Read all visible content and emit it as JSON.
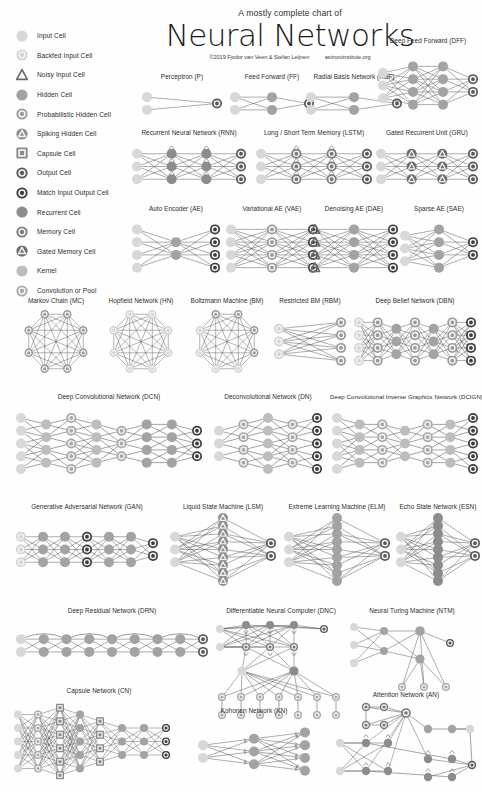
{
  "title": {
    "superline": "A mostly complete chart of",
    "main": "Neural Networks",
    "copyright": "©2019 Fjodor van Veen & Stefan Leijnen",
    "url": "asimovinstitute.org"
  },
  "palette": {
    "input": "#d8d8d8",
    "backfed": "#d4d4d4",
    "noisy": "#d0d0d0",
    "hidden": "#a3a3a3",
    "prob_hidden": "#9a9a9a",
    "spiking": "#8f8f8f",
    "capsule": "#8a8a8a",
    "output": "#585858",
    "match": "#3c3c3c",
    "recurrent": "#8c8c8c",
    "memory": "#7a7a7a",
    "gated": "#6d6d6d",
    "kernel": "#bdbdbd",
    "conv": "#a8a8a8",
    "edge": "#4a4a4a",
    "ring": "#f2f2f2",
    "text": "#2b2b2b"
  },
  "legend": {
    "items": [
      {
        "id": "input",
        "label": "Input Cell",
        "shape": "circle",
        "color_key": "input"
      },
      {
        "id": "backfed",
        "label": "Backfed Input Cell",
        "shape": "ring",
        "color_key": "backfed"
      },
      {
        "id": "noisy",
        "label": "Noisy Input Cell",
        "shape": "triangle",
        "color_key": "noisy"
      },
      {
        "id": "hidden",
        "label": "Hidden Cell",
        "shape": "circle",
        "color_key": "hidden"
      },
      {
        "id": "prob_hidden",
        "label": "Probabilistic Hidden Cell",
        "shape": "ring",
        "color_key": "prob_hidden"
      },
      {
        "id": "spiking",
        "label": "Spiking Hidden Cell",
        "shape": "tri-in-circle",
        "color_key": "spiking"
      },
      {
        "id": "capsule",
        "label": "Capsule Cell",
        "shape": "square",
        "color_key": "capsule"
      },
      {
        "id": "output",
        "label": "Output Cell",
        "shape": "ring",
        "color_key": "output"
      },
      {
        "id": "match",
        "label": "Match Input Output Cell",
        "shape": "ring",
        "color_key": "match"
      },
      {
        "id": "recurrent",
        "label": "Recurrent Cell",
        "shape": "circle",
        "color_key": "recurrent"
      },
      {
        "id": "memory",
        "label": "Memory Cell",
        "shape": "ring",
        "color_key": "memory"
      },
      {
        "id": "gated",
        "label": "Gated Memory Cell",
        "shape": "tri-in-circle",
        "color_key": "gated"
      },
      {
        "id": "kernel",
        "label": "Kernel",
        "shape": "circle",
        "color_key": "kernel"
      },
      {
        "id": "conv",
        "label": "Convolution or Pool",
        "shape": "ring",
        "color_key": "conv"
      }
    ]
  },
  "networks": [
    {
      "id": "p",
      "name": "Perceptron (P)",
      "abbr": "P",
      "x": 140,
      "y": 72,
      "w": 84,
      "h": 56,
      "layers": [
        {
          "type": "input",
          "n": 2
        },
        {
          "type": "output",
          "n": 1
        }
      ],
      "link": "full"
    },
    {
      "id": "ff",
      "name": "Feed Forward (FF)",
      "abbr": "FF",
      "x": 228,
      "y": 72,
      "w": 88,
      "h": 56,
      "layers": [
        {
          "type": "input",
          "n": 2
        },
        {
          "type": "hidden",
          "n": 2
        },
        {
          "type": "output",
          "n": 1
        }
      ],
      "link": "full"
    },
    {
      "id": "rbf",
      "name": "Radial Basis Network (RBF)",
      "abbr": "RBF",
      "x": 304,
      "y": 72,
      "w": 100,
      "h": 56,
      "layers": [
        {
          "type": "input",
          "n": 2
        },
        {
          "type": "hidden",
          "n": 2
        },
        {
          "type": "output",
          "n": 1
        }
      ],
      "link": "full"
    },
    {
      "id": "dff",
      "name": "Deep Feed Forward (DFF)",
      "abbr": "DFF",
      "x": 376,
      "y": 36,
      "w": 104,
      "h": 92,
      "layers": [
        {
          "type": "input",
          "n": 3
        },
        {
          "type": "hidden",
          "n": 4
        },
        {
          "type": "hidden",
          "n": 4
        },
        {
          "type": "output",
          "n": 2
        }
      ],
      "link": "full"
    },
    {
      "id": "rnn",
      "name": "Recurrent Neural Network (RNN)",
      "abbr": "RNN",
      "x": 130,
      "y": 128,
      "w": 118,
      "h": 70,
      "layers": [
        {
          "type": "input",
          "n": 3
        },
        {
          "type": "recurrent",
          "n": 3
        },
        {
          "type": "recurrent",
          "n": 3
        },
        {
          "type": "output",
          "n": 3
        }
      ],
      "link": "full",
      "self_loops": [
        1,
        2
      ]
    },
    {
      "id": "lstm",
      "name": "Long / Short Term Memory (LSTM)",
      "abbr": "LSTM",
      "x": 254,
      "y": 128,
      "w": 120,
      "h": 70,
      "layers": [
        {
          "type": "input",
          "n": 3
        },
        {
          "type": "memory",
          "n": 3
        },
        {
          "type": "memory",
          "n": 3
        },
        {
          "type": "output",
          "n": 3
        }
      ],
      "link": "full",
      "self_loops": [
        1,
        2
      ]
    },
    {
      "id": "gru",
      "name": "Gated Recurrent Unit (GRU)",
      "abbr": "GRU",
      "x": 374,
      "y": 128,
      "w": 106,
      "h": 70,
      "layers": [
        {
          "type": "input",
          "n": 3
        },
        {
          "type": "gated",
          "n": 3
        },
        {
          "type": "gated",
          "n": 3
        },
        {
          "type": "output",
          "n": 3
        }
      ],
      "link": "full"
    },
    {
      "id": "ae",
      "name": "Auto Encoder (AE)",
      "abbr": "AE",
      "x": 130,
      "y": 204,
      "w": 92,
      "h": 82,
      "layers": [
        {
          "type": "input",
          "n": 4
        },
        {
          "type": "hidden",
          "n": 2
        },
        {
          "type": "match",
          "n": 4
        }
      ],
      "link": "full"
    },
    {
      "id": "vae",
      "name": "Variational AE (VAE)",
      "abbr": "VAE",
      "x": 224,
      "y": 204,
      "w": 96,
      "h": 82,
      "layers": [
        {
          "type": "input",
          "n": 4
        },
        {
          "type": "prob_hidden",
          "n": 4
        },
        {
          "type": "match",
          "n": 4
        }
      ],
      "link": "full"
    },
    {
      "id": "dae",
      "name": "Denoising AE (DAE)",
      "abbr": "DAE",
      "x": 308,
      "y": 204,
      "w": 92,
      "h": 82,
      "layers": [
        {
          "type": "noisy",
          "n": 4
        },
        {
          "type": "hidden",
          "n": 4
        },
        {
          "type": "match",
          "n": 4
        }
      ],
      "link": "full"
    },
    {
      "id": "sae",
      "name": "Sparse AE (SAE)",
      "abbr": "SAE",
      "x": 398,
      "y": 204,
      "w": 82,
      "h": 82,
      "layers": [
        {
          "type": "input",
          "n": 3
        },
        {
          "type": "hidden",
          "n": 4
        },
        {
          "type": "match",
          "n": 2
        }
      ],
      "link": "full"
    },
    {
      "id": "mc",
      "name": "Markov Chain (MC)",
      "abbr": "MC",
      "x": 14,
      "y": 296,
      "w": 84,
      "h": 84,
      "topology": "ring-complete",
      "n": 8,
      "type": "prob_hidden"
    },
    {
      "id": "hn",
      "name": "Hopfield Network (HN)",
      "abbr": "HN",
      "x": 98,
      "y": 296,
      "w": 86,
      "h": 84,
      "topology": "ring-complete",
      "n": 8,
      "type": "backfed"
    },
    {
      "id": "bm",
      "name": "Boltzmann Machine (BM)",
      "abbr": "BM",
      "x": 184,
      "y": 296,
      "w": 86,
      "h": 84,
      "topology": "ring-complete",
      "n": 8,
      "type": "backfed",
      "alt_type": "prob_hidden",
      "alt_indices": [
        0,
        1,
        2,
        7
      ]
    },
    {
      "id": "rbm",
      "name": "Restricted BM (RBM)",
      "abbr": "RBM",
      "x": 272,
      "y": 296,
      "w": 76,
      "h": 84,
      "layers": [
        {
          "type": "backfed",
          "n": 3
        },
        {
          "type": "prob_hidden",
          "n": 4
        }
      ],
      "link": "full"
    },
    {
      "id": "dbn",
      "name": "Deep Belief Network (DBN)",
      "abbr": "DBN",
      "x": 352,
      "y": 296,
      "w": 126,
      "h": 84,
      "layers": [
        {
          "type": "backfed",
          "n": 4
        },
        {
          "type": "prob_hidden",
          "n": 4
        },
        {
          "type": "hidden",
          "n": 3
        },
        {
          "type": "prob_hidden",
          "n": 4
        },
        {
          "type": "hidden",
          "n": 3
        },
        {
          "type": "prob_hidden",
          "n": 4
        },
        {
          "type": "match",
          "n": 4
        }
      ],
      "link": "full"
    },
    {
      "id": "dcn",
      "name": "Deep Convolutional Network (DCN)",
      "abbr": "DCN",
      "x": 14,
      "y": 392,
      "w": 190,
      "h": 96,
      "layers": [
        {
          "type": "input",
          "n": 5
        },
        {
          "type": "kernel",
          "n": 4
        },
        {
          "type": "conv",
          "n": 5
        },
        {
          "type": "kernel",
          "n": 4
        },
        {
          "type": "conv",
          "n": 3
        },
        {
          "type": "hidden",
          "n": 4
        },
        {
          "type": "hidden",
          "n": 4
        },
        {
          "type": "match",
          "n": 3
        }
      ],
      "link": "conv"
    },
    {
      "id": "dn",
      "name": "Deconvolutional Network (DN)",
      "abbr": "DN",
      "x": 212,
      "y": 392,
      "w": 112,
      "h": 96,
      "layers": [
        {
          "type": "input",
          "n": 3
        },
        {
          "type": "conv",
          "n": 4
        },
        {
          "type": "kernel",
          "n": 5
        },
        {
          "type": "conv",
          "n": 4
        },
        {
          "type": "match",
          "n": 5
        }
      ],
      "link": "conv"
    },
    {
      "id": "dcign",
      "name": "Deep Convolutional Inverse Graphics Network (DCIGN)",
      "abbr": "DCIGN",
      "x": 330,
      "y": 392,
      "w": 150,
      "h": 96,
      "layers": [
        {
          "type": "input",
          "n": 5
        },
        {
          "type": "kernel",
          "n": 4
        },
        {
          "type": "conv",
          "n": 4
        },
        {
          "type": "kernel",
          "n": 3
        },
        {
          "type": "conv",
          "n": 4
        },
        {
          "type": "kernel",
          "n": 4
        },
        {
          "type": "match",
          "n": 5
        }
      ],
      "link": "conv"
    },
    {
      "id": "gan",
      "name": "Generative Adversarial Network (GAN)",
      "abbr": "GAN",
      "x": 14,
      "y": 502,
      "w": 146,
      "h": 88,
      "layers": [
        {
          "type": "backfed",
          "n": 3
        },
        {
          "type": "hidden",
          "n": 3
        },
        {
          "type": "hidden",
          "n": 3
        },
        {
          "type": "match",
          "n": 3
        },
        {
          "type": "hidden",
          "n": 3
        },
        {
          "type": "hidden",
          "n": 3
        },
        {
          "type": "match",
          "n": 2
        }
      ],
      "link": "full"
    },
    {
      "id": "lsm",
      "name": "Liquid State Machine (LSM)",
      "abbr": "LSM",
      "x": 168,
      "y": 502,
      "w": 110,
      "h": 88,
      "layers": [
        {
          "type": "input",
          "n": 3
        },
        {
          "type": "spiking",
          "n": 9
        },
        {
          "type": "output",
          "n": 2
        }
      ],
      "link": "random",
      "cloud": true
    },
    {
      "id": "elm",
      "name": "Extreme Learning Machine (ELM)",
      "abbr": "ELM",
      "x": 282,
      "y": 502,
      "w": 110,
      "h": 88,
      "layers": [
        {
          "type": "input",
          "n": 3
        },
        {
          "type": "hidden",
          "n": 9
        },
        {
          "type": "output",
          "n": 2
        }
      ],
      "link": "random",
      "cloud": true
    },
    {
      "id": "esn",
      "name": "Echo State Network (ESN)",
      "abbr": "ESN",
      "x": 394,
      "y": 502,
      "w": 88,
      "h": 88,
      "layers": [
        {
          "type": "input",
          "n": 3
        },
        {
          "type": "recurrent",
          "n": 9
        },
        {
          "type": "output",
          "n": 2
        }
      ],
      "link": "random",
      "cloud": true
    },
    {
      "id": "drn",
      "name": "Deep Residual Network (DRN)",
      "abbr": "DRN",
      "x": 14,
      "y": 606,
      "w": 196,
      "h": 72,
      "layers": [
        {
          "type": "input",
          "n": 2
        },
        {
          "type": "hidden",
          "n": 2
        },
        {
          "type": "hidden",
          "n": 2
        },
        {
          "type": "hidden",
          "n": 2
        },
        {
          "type": "hidden",
          "n": 2
        },
        {
          "type": "hidden",
          "n": 2
        },
        {
          "type": "hidden",
          "n": 2
        },
        {
          "type": "hidden",
          "n": 2
        },
        {
          "type": "output",
          "n": 2
        }
      ],
      "link": "full",
      "skip": true
    },
    {
      "id": "dnc",
      "name": "Differentiable Neural Computer (DNC)",
      "abbr": "DNC",
      "x": 212,
      "y": 606,
      "w": 138,
      "h": 112,
      "topology": "dnc"
    },
    {
      "id": "ntm",
      "name": "Neural Turing Machine (NTM)",
      "abbr": "NTM",
      "x": 346,
      "y": 606,
      "w": 132,
      "h": 100,
      "topology": "ntm"
    },
    {
      "id": "cn",
      "name": "Capsule Network (CN)",
      "abbr": "CN",
      "x": 10,
      "y": 686,
      "w": 178,
      "h": 104,
      "topology": "capsule"
    },
    {
      "id": "kn",
      "name": "Kohonen Network (KN)",
      "abbr": "KN",
      "x": 196,
      "y": 706,
      "w": 116,
      "h": 84,
      "layers": [
        {
          "type": "input",
          "n": 2
        },
        {
          "type": "hidden",
          "n": 3
        },
        {
          "type": "hidden",
          "n": 4
        }
      ],
      "link": "kohonen"
    },
    {
      "id": "an",
      "name": "Attention Network (AN)",
      "abbr": "AN",
      "x": 332,
      "y": 690,
      "w": 148,
      "h": 100,
      "topology": "attention"
    }
  ]
}
